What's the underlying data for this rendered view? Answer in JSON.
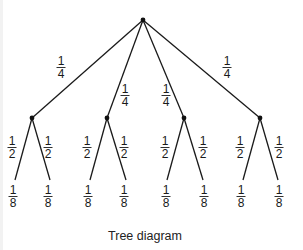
{
  "caption": "Tree diagram",
  "colors": {
    "line": "#1a1a1a",
    "node": "#111111",
    "text": "#1a1a1a",
    "background": "#ffffff"
  },
  "tree": {
    "root": {
      "x": 143,
      "y": 20
    },
    "level1": [
      {
        "x": 32,
        "y": 118,
        "edge_label": {
          "num": "1",
          "den": "4",
          "x": 61,
          "y": 55
        }
      },
      {
        "x": 107,
        "y": 118,
        "edge_label": {
          "num": "1",
          "den": "4",
          "x": 125,
          "y": 83
        }
      },
      {
        "x": 184,
        "y": 118,
        "edge_label": {
          "num": "1",
          "den": "4",
          "x": 166,
          "y": 83
        }
      },
      {
        "x": 260,
        "y": 118,
        "edge_label": {
          "num": "1",
          "den": "4",
          "x": 227,
          "y": 55
        }
      }
    ],
    "level2_edge_label": {
      "num": "1",
      "den": "2"
    },
    "leaf_label": {
      "num": "1",
      "den": "8"
    },
    "leaves": [
      {
        "parent": 0,
        "x": 15,
        "y": 180,
        "edge_label_x": 12,
        "leaf_label_x": 13
      },
      {
        "parent": 0,
        "x": 50,
        "y": 180,
        "edge_label_x": 48,
        "leaf_label_x": 48
      },
      {
        "parent": 1,
        "x": 90,
        "y": 180,
        "edge_label_x": 87,
        "leaf_label_x": 88
      },
      {
        "parent": 1,
        "x": 126,
        "y": 180,
        "edge_label_x": 124,
        "leaf_label_x": 124
      },
      {
        "parent": 2,
        "x": 167,
        "y": 180,
        "edge_label_x": 165,
        "leaf_label_x": 166
      },
      {
        "parent": 2,
        "x": 203,
        "y": 180,
        "edge_label_x": 203,
        "leaf_label_x": 204
      },
      {
        "parent": 3,
        "x": 243,
        "y": 180,
        "edge_label_x": 240,
        "leaf_label_x": 241
      },
      {
        "parent": 3,
        "x": 278,
        "y": 180,
        "edge_label_x": 279,
        "leaf_label_x": 279
      }
    ],
    "level2_label_y": 135,
    "leaf_label_y": 184
  }
}
